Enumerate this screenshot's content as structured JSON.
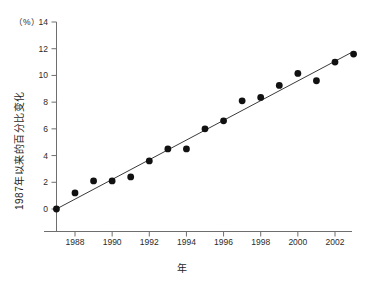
{
  "chart_data": {
    "type": "scatter",
    "title": "",
    "xlabel": "年",
    "ylabel": "1987年以来的百分比变化",
    "y_unit_label": "（%）",
    "xlim": [
      1986.4,
      2003.6
    ],
    "ylim": [
      -2,
      14
    ],
    "grid": false,
    "legend": "none",
    "x_ticks": [
      1988,
      1990,
      1992,
      1994,
      1996,
      1998,
      2000,
      2002
    ],
    "x_tick_labels": [
      "1988",
      "1990",
      "1992",
      "1994",
      "1996",
      "1998",
      "2000",
      "2002"
    ],
    "y_ticks": [
      0,
      2,
      4,
      6,
      8,
      10,
      12,
      14
    ],
    "y_tick_labels": [
      "0",
      "2",
      "4",
      "6",
      "8",
      "10",
      "12",
      "14"
    ],
    "x": [
      1987,
      1988,
      1989,
      1990,
      1991,
      1992,
      1993,
      1994,
      1995,
      1996,
      1997,
      1998,
      1999,
      2000,
      2001,
      2002,
      2003
    ],
    "values": [
      0.0,
      1.2,
      2.1,
      2.1,
      2.4,
      3.6,
      4.5,
      4.5,
      6.0,
      6.6,
      8.1,
      8.35,
      9.25,
      10.15,
      9.6,
      11.0,
      11.6
    ],
    "series": [
      {
        "name": "年度百分比变化",
        "marker": "filled-circle",
        "color": "#111111",
        "values": [
          0.0,
          1.2,
          2.1,
          2.1,
          2.4,
          3.6,
          4.5,
          4.5,
          6.0,
          6.6,
          8.1,
          8.35,
          9.25,
          10.15,
          9.6,
          11.0,
          11.6
        ]
      }
    ],
    "trendline": {
      "name": "线性趋势线",
      "color": "#3a3a3a",
      "x_start": 1987,
      "y_start": 0.0,
      "x_end": 2003,
      "y_end": 11.8
    },
    "colors": {
      "marker": "#111111",
      "trendline": "#3a3a3a",
      "axis": "#6e6e6e",
      "text": "#1f1f1f",
      "background": "#ffffff"
    }
  }
}
